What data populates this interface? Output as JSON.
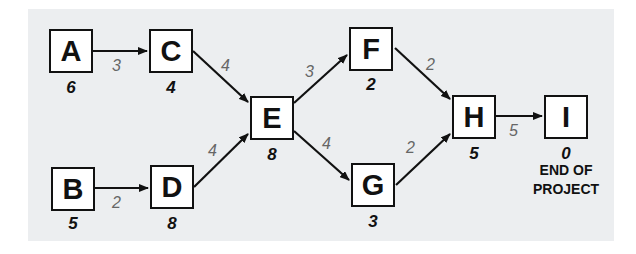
{
  "diagram": {
    "type": "activity-network",
    "background_color": "#eceef0",
    "nodes": [
      {
        "id": "A",
        "label": "A",
        "duration": "6"
      },
      {
        "id": "B",
        "label": "B",
        "duration": "5"
      },
      {
        "id": "C",
        "label": "C",
        "duration": "4"
      },
      {
        "id": "D",
        "label": "D",
        "duration": "8"
      },
      {
        "id": "E",
        "label": "E",
        "duration": "8"
      },
      {
        "id": "F",
        "label": "F",
        "duration": "2"
      },
      {
        "id": "G",
        "label": "G",
        "duration": "3"
      },
      {
        "id": "H",
        "label": "H",
        "duration": "5"
      },
      {
        "id": "I",
        "label": "I",
        "duration": "0",
        "note_line1": "END OF",
        "note_line2": "PROJECT"
      }
    ],
    "edges": [
      {
        "from": "A",
        "to": "C",
        "label": "3"
      },
      {
        "from": "B",
        "to": "D",
        "label": "2"
      },
      {
        "from": "C",
        "to": "E",
        "label": "4"
      },
      {
        "from": "D",
        "to": "E",
        "label": "4"
      },
      {
        "from": "E",
        "to": "F",
        "label": "3"
      },
      {
        "from": "E",
        "to": "G",
        "label": "4"
      },
      {
        "from": "F",
        "to": "H",
        "label": "2"
      },
      {
        "from": "G",
        "to": "H",
        "label": "2"
      },
      {
        "from": "H",
        "to": "I",
        "label": "5"
      }
    ]
  }
}
